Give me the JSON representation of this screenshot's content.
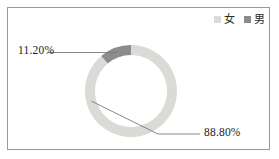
{
  "chart_data": {
    "type": "pie",
    "variant": "donut",
    "title": "",
    "categories": [
      "女",
      "男"
    ],
    "values": [
      88.8,
      11.2
    ],
    "value_labels": [
      "88.80%",
      "11.20%"
    ],
    "unit": "%",
    "colors": [
      "#d9dcd6",
      "#8c8c8c"
    ],
    "legend": {
      "position": "top-right",
      "entries": [
        {
          "label": "女",
          "color": "#d9dcd6"
        },
        {
          "label": "男",
          "color": "#8c8c8c"
        }
      ]
    },
    "start_angle_deg": 0,
    "direction": "clockwise",
    "inner_radius_ratio": 0.78,
    "grid": false,
    "frame": true,
    "frame_color": "#9a9a9a",
    "leader_line_color": "#7a7a7a",
    "background": "#ffffff"
  },
  "legend": {
    "items": [
      {
        "label": "女",
        "color": "#d9dcd6"
      },
      {
        "label": "男",
        "color": "#8c8c8c"
      }
    ]
  },
  "labels": {
    "female_pct": "88.80%",
    "male_pct": "11.20%"
  },
  "geometry": {
    "center_x": 123,
    "center_y": 83,
    "outer_radius": 46,
    "inner_radius": 36
  }
}
